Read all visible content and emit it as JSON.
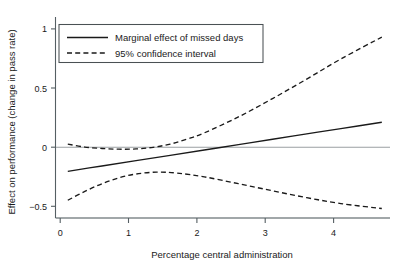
{
  "chart_data": {
    "type": "line",
    "title": "",
    "xlabel": "Percentage central administration",
    "ylabel": "Effect on performance (change in pass rate)",
    "xlim": [
      -0.18,
      4.72
    ],
    "ylim": [
      -0.62,
      1.08
    ],
    "xticks": [
      0,
      1,
      2,
      3,
      4
    ],
    "xticklabels": [
      "0",
      "1",
      "2",
      "3",
      "4"
    ],
    "yticks": [
      -0.5,
      0,
      0.5,
      1
    ],
    "yticklabels": [
      "−0.5",
      "0",
      "0.5",
      "1"
    ],
    "grid": false,
    "legend_position": "upper left",
    "reference_lines": [
      {
        "name": "zero-line",
        "orientation": "horizontal",
        "value": 0,
        "color": "#9a9fa2"
      },
      {
        "name": "bottom-line",
        "orientation": "horizontal",
        "value": -0.6,
        "color": "#9a9fa2"
      }
    ],
    "series": [
      {
        "name": "Marginal effect of missed days",
        "style": "solid",
        "color": "#1a1a1a",
        "x": [
          0.0,
          0.5,
          1.0,
          1.5,
          2.0,
          2.5,
          3.0,
          3.5,
          4.0,
          4.6
        ],
        "values": [
          -0.225,
          -0.18,
          -0.135,
          -0.09,
          -0.045,
          0.0,
          0.046,
          0.091,
          0.136,
          0.19
        ]
      },
      {
        "name": "95% confidence interval upper",
        "style": "dashed",
        "color": "#1a1a1a",
        "x": [
          0.0,
          0.25,
          0.5,
          0.75,
          1.0,
          1.25,
          1.5,
          1.75,
          2.0,
          2.5,
          3.0,
          3.5,
          4.0,
          4.6
        ],
        "values": [
          0.005,
          -0.02,
          -0.032,
          -0.038,
          -0.036,
          -0.022,
          0.005,
          0.048,
          0.1,
          0.235,
          0.39,
          0.555,
          0.725,
          0.91
        ]
      },
      {
        "name": "95% confidence interval lower",
        "style": "dashed",
        "color": "#1a1a1a",
        "x": [
          0.0,
          0.25,
          0.5,
          0.75,
          1.0,
          1.3,
          1.6,
          2.0,
          2.5,
          3.0,
          3.5,
          4.0,
          4.6
        ],
        "values": [
          -0.47,
          -0.395,
          -0.33,
          -0.28,
          -0.248,
          -0.232,
          -0.24,
          -0.272,
          -0.33,
          -0.39,
          -0.448,
          -0.498,
          -0.54
        ]
      }
    ],
    "legend_entries": [
      {
        "label": "Marginal effect of missed days",
        "style": "solid"
      },
      {
        "label": "95% confidence interval",
        "style": "dashed"
      }
    ]
  }
}
